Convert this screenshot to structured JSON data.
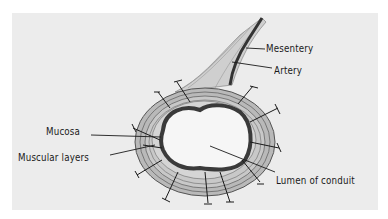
{
  "diagram": {
    "labels": {
      "mesentery": "Mesentery",
      "artery": "Artery",
      "mucosa": "Mucosa",
      "muscular_layers": "Muscular layers",
      "lumen": "Lumen of conduit"
    },
    "colors": {
      "background": "#ececec",
      "ink": "#1a1a1a",
      "mucosa": "#3a3a3a",
      "layers": "#8a8a8a",
      "lumen": "#f6f6f6"
    }
  }
}
